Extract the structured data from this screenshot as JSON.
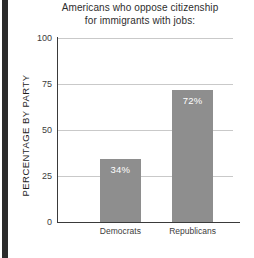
{
  "chart_data": {
    "type": "bar",
    "title": "Americans who oppose citizenship for immigrants with jobs:",
    "title_lines": [
      "Americans who oppose citizenship",
      "for immigrants with jobs:"
    ],
    "xlabel": "",
    "ylabel": "PERCENTAGE BY PARTY",
    "categories": [
      "Democrats",
      "Republicans"
    ],
    "values": [
      34,
      72
    ],
    "value_labels": [
      "34%",
      "72%"
    ],
    "ylim": [
      0,
      100
    ],
    "yticks": [
      0,
      25,
      50,
      75,
      100
    ],
    "ytick_labels": [
      "0",
      "25",
      "50",
      "75",
      "100"
    ],
    "grid": true,
    "legend": false,
    "bar_color": "#8e8e8e",
    "value_label_color": "#ffffff",
    "axis_color": "#3a3a3a",
    "gridline_color": "#c9c9c9"
  }
}
